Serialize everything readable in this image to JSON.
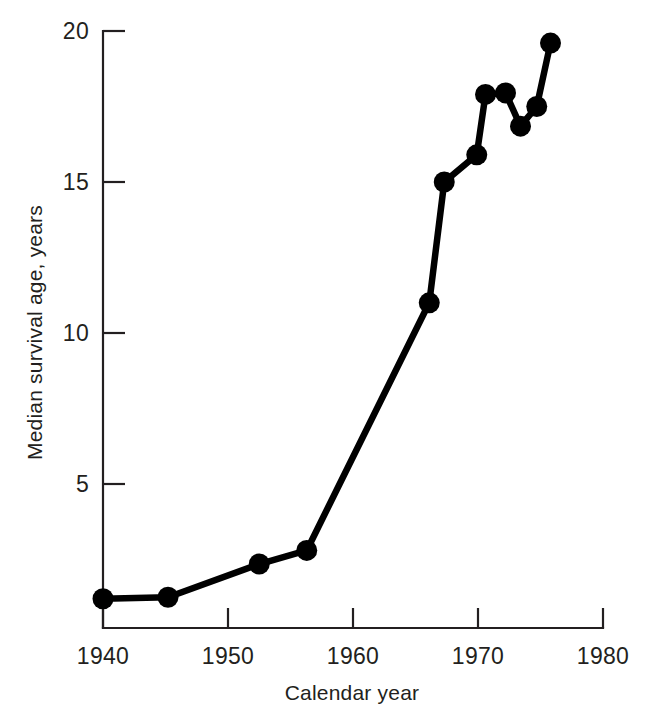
{
  "chart_data": {
    "type": "line",
    "title": "",
    "subtitle": "",
    "xlabel": "Calendar year",
    "ylabel": "Median survival age, years",
    "xlim": [
      1940,
      1980
    ],
    "ylim": [
      0.2,
      20
    ],
    "grid": false,
    "legend": "none",
    "xticks": [
      1940,
      1950,
      1960,
      1970,
      1980
    ],
    "xtick_labels": [
      "1940",
      "1950",
      "1960",
      "1970",
      "1980"
    ],
    "yticks": [
      5,
      10,
      15,
      20
    ],
    "ytick_labels": [
      "5",
      "10",
      "15",
      "20"
    ],
    "marker": "filled-circle",
    "series": [
      {
        "name": "Median survival age",
        "x": [
          1940.0,
          1945.2,
          1952.5,
          1956.3,
          1966.1,
          1967.3,
          1969.9,
          1970.6,
          1972.2,
          1973.4,
          1974.7,
          1975.8
        ],
        "y": [
          1.2,
          1.25,
          2.35,
          2.8,
          11.0,
          15.0,
          15.9,
          17.9,
          17.95,
          16.85,
          17.5,
          19.6
        ],
        "points": [
          {
            "x": 1940.0,
            "y": 1.2
          },
          {
            "x": 1945.2,
            "y": 1.25
          },
          {
            "x": 1952.5,
            "y": 2.35
          },
          {
            "x": 1956.3,
            "y": 2.8
          },
          {
            "x": 1966.1,
            "y": 11.0
          },
          {
            "x": 1967.3,
            "y": 15.0
          },
          {
            "x": 1969.9,
            "y": 15.9
          },
          {
            "x": 1970.6,
            "y": 17.9
          },
          {
            "x": 1972.2,
            "y": 17.95
          },
          {
            "x": 1973.4,
            "y": 16.85
          },
          {
            "x": 1974.7,
            "y": 17.5
          },
          {
            "x": 1975.8,
            "y": 19.6
          }
        ]
      }
    ],
    "colors": {
      "line": "#000000",
      "marker": "#000000",
      "axis": "#231f20",
      "background": "#ffffff"
    }
  }
}
